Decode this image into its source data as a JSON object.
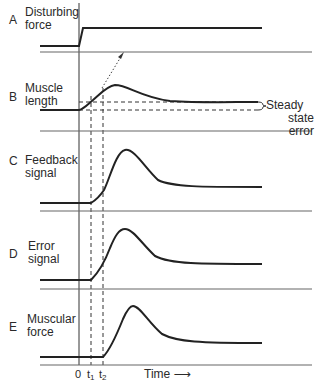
{
  "panels": [
    {
      "letter": "A",
      "label_line1": "Disturbing",
      "label_line2": "force"
    },
    {
      "letter": "B",
      "label_line1": "Muscle",
      "label_line2": "length"
    },
    {
      "letter": "C",
      "label_line1": "Feedback",
      "label_line2": "signal"
    },
    {
      "letter": "D",
      "label_line1": "Error",
      "label_line2": "signal"
    },
    {
      "letter": "E",
      "label_line1": "Muscular",
      "label_line2": "force"
    }
  ],
  "annotation": {
    "line1": "Steady",
    "line2": "state",
    "line3": "error"
  },
  "x_axis": {
    "tick_0": "0",
    "tick_t1_base": "t",
    "tick_t1_sub": "1",
    "tick_t2_base": "t",
    "tick_t2_sub": "2",
    "label": "Time",
    "arrow": "⟶"
  },
  "colors": {
    "line": "#222222",
    "baseline": "#555555",
    "dashed": "#333333"
  }
}
